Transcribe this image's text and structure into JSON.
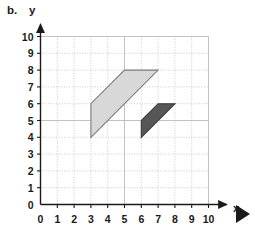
{
  "figure": {
    "part_label": "b.",
    "x_axis_label": "x",
    "y_axis_label": "y",
    "play_marker_icon": "play-triangle-icon"
  },
  "colors": {
    "axis": "#1a1a1a",
    "grid": "#b9b9b9",
    "shape_light_fill": "#d8d8d8",
    "shape_light_stroke": "#7d7d7d",
    "shape_dark_fill": "#565656",
    "shape_dark_stroke": "#3a3a3a",
    "marker": "#1a1a1a"
  },
  "chart_data": {
    "type": "scatter",
    "title": "",
    "xlabel": "x",
    "ylabel": "y",
    "xlim": [
      0,
      10
    ],
    "ylim": [
      0,
      10
    ],
    "grid": true,
    "legend": "none",
    "x_ticks": [
      "0",
      "1",
      "2",
      "3",
      "4",
      "5",
      "6",
      "7",
      "8",
      "9",
      "10"
    ],
    "y_ticks": [
      "0",
      "1",
      "2",
      "3",
      "4",
      "5",
      "6",
      "7",
      "8",
      "9",
      "10"
    ],
    "x_tick_values": [
      0,
      1,
      2,
      3,
      4,
      5,
      6,
      7,
      8,
      9,
      10
    ],
    "y_tick_values": [
      0,
      1,
      2,
      3,
      4,
      5,
      6,
      7,
      8,
      9,
      10
    ],
    "shapes": [
      {
        "name": "light-parallelogram",
        "kind": "parallelogram",
        "fill": "#d8d8d8",
        "stroke": "#7d7d7d",
        "vertices": [
          [
            3,
            4
          ],
          [
            3,
            6
          ],
          [
            5,
            8
          ],
          [
            7,
            8
          ]
        ],
        "vertices_label": "(3,4) (3,6) (5,8) (7,8)"
      },
      {
        "name": "dark-parallelogram",
        "kind": "parallelogram",
        "fill": "#565656",
        "stroke": "#3a3a3a",
        "vertices": [
          [
            6,
            4
          ],
          [
            6,
            5
          ],
          [
            7,
            6
          ],
          [
            8,
            6
          ]
        ],
        "vertices_label": "(6,4) (6,5) (7,6) (8,6)"
      }
    ]
  }
}
